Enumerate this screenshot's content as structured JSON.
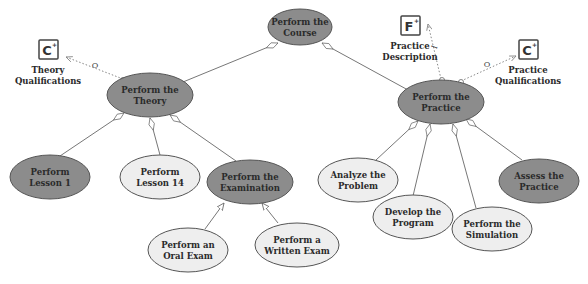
{
  "colors": {
    "dark_fill": "#8c8c8c",
    "light_fill": "#eeeeee",
    "stroke": "#555555",
    "line": "#777777",
    "dotted": "#888888",
    "background": "#ffffff"
  },
  "nodes": {
    "course": {
      "line1": "Perform the",
      "line2": "Course",
      "fill": "dark"
    },
    "theory": {
      "line1": "Perform the",
      "line2": "Theory",
      "fill": "dark"
    },
    "practice": {
      "line1": "Perform the",
      "line2": "Practice",
      "fill": "dark"
    },
    "lesson1": {
      "line1": "Perform",
      "line2": "Lesson 1",
      "fill": "dark"
    },
    "lesson14": {
      "line1": "Perform",
      "line2": "Lesson 14",
      "fill": "light"
    },
    "examination": {
      "line1": "Perform the",
      "line2": "Examination",
      "fill": "dark"
    },
    "oral_exam": {
      "line1": "Perform an",
      "line2": "Oral Exam",
      "fill": "light"
    },
    "written_exam": {
      "line1": "Perform a",
      "line2": "Written Exam",
      "fill": "light"
    },
    "analyze": {
      "line1": "Analyze the",
      "line2": "Problem",
      "fill": "light"
    },
    "develop": {
      "line1": "Develop the",
      "line2": "Program",
      "fill": "light"
    },
    "simulation": {
      "line1": "Perform the",
      "line2": "Simulation",
      "fill": "light"
    },
    "assess": {
      "line1": "Assess the",
      "line2": "Practice",
      "fill": "dark"
    }
  },
  "resources": {
    "theory_qualifications": {
      "icon": "C",
      "line1": "Theory",
      "line2": "Qualifications",
      "link_label": "O"
    },
    "practice_description": {
      "icon": "F",
      "line1": "Practice",
      "line2": "Description",
      "link_label": "I"
    },
    "practice_qualifications": {
      "icon": "C",
      "line1": "Practice",
      "line2": "Qualifications",
      "link_label": "O"
    }
  },
  "icon_plus": "+"
}
